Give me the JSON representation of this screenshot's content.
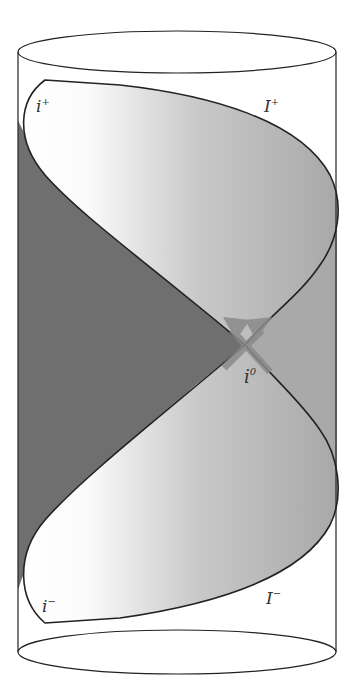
{
  "labels": {
    "future_timelike_infinity": "i",
    "future_timelike_infinity_sup": "+",
    "future_null_infinity": "I",
    "future_null_infinity_sup": "+",
    "spatial_infinity": "i",
    "spatial_infinity_sup": "0",
    "past_timelike_infinity": "i",
    "past_timelike_infinity_sup": "−",
    "past_null_infinity": "I",
    "past_null_infinity_sup": "−"
  },
  "colors": {
    "outline": "#222222",
    "dark_region": "#6f6f6f",
    "gray_region": "#a9a9a9",
    "lens_light": "#fbfbfb",
    "lens_mid": "#c8c8c8",
    "lens_dark": "#a6a6a6",
    "arrow": "#8a8a8a",
    "background": "#ffffff"
  }
}
